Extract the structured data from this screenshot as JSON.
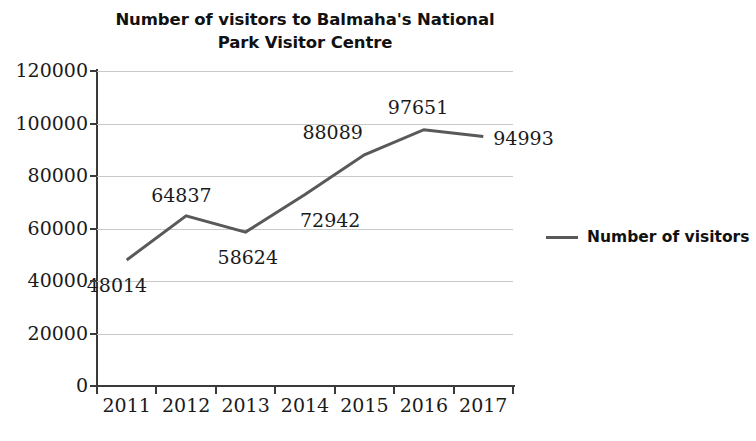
{
  "chart_data": {
    "type": "line",
    "title": "Number of visitors to Balmaha's National Park Visitor Centre",
    "title_line1": "Number of visitors to Balmaha's National",
    "title_line2": "Park Visitor Centre",
    "xlabel": "",
    "ylabel": "",
    "categories": [
      "2011",
      "2012",
      "2013",
      "2014",
      "2015",
      "2016",
      "2017"
    ],
    "values": [
      48014,
      64837,
      58624,
      72942,
      88089,
      97651,
      94993
    ],
    "point_labels": [
      "48014",
      "64837",
      "58624",
      "72942",
      "88089",
      "97651",
      "94993"
    ],
    "series": [
      {
        "name": "Number of visitors",
        "values": [
          48014,
          64837,
          58624,
          72942,
          88089,
          97651,
          94993
        ],
        "color": "#595959"
      }
    ],
    "ylim": [
      0,
      120000
    ],
    "yticks": [
      0,
      20000,
      40000,
      60000,
      80000,
      100000,
      120000
    ],
    "ytick_labels": [
      "0",
      "20000",
      "40000",
      "60000",
      "80000",
      "100000",
      "120000"
    ],
    "grid": true,
    "grid_axis": "y",
    "grid_color": "#c9c9c9",
    "legend": {
      "position": "right",
      "entries": [
        {
          "label": "Number of visitors",
          "color": "#595959"
        }
      ]
    },
    "axis_color": "#3a3a3a",
    "background": "#ffffff"
  },
  "legend": {
    "label": "Number of visitors"
  }
}
